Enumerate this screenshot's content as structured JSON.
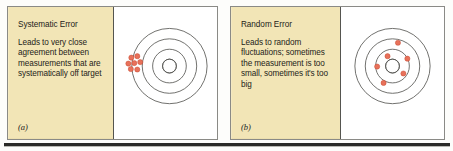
{
  "figure": {
    "background_color": "#fdfdfb",
    "rule_color": "#2b2b28"
  },
  "panels": [
    {
      "id": "a",
      "label": "(a)",
      "title": "Systematic Error",
      "body": "Leads to very close agreement between measurements that are systematically off target",
      "pane_color": "#f2e5b6",
      "target": {
        "center": {
          "x": 56,
          "y": 59
        },
        "ring_radii": [
          7,
          17,
          27.5,
          38,
          48.5
        ],
        "ring_color": "#575753",
        "shot_color": "#e8715a",
        "shot_radius": 2.6,
        "shots": [
          {
            "x": 17.5,
            "y": 50.5
          },
          {
            "x": 23.5,
            "y": 49.0
          },
          {
            "x": 14.5,
            "y": 56.5
          },
          {
            "x": 20.5,
            "y": 56.0
          },
          {
            "x": 26.5,
            "y": 55.0
          },
          {
            "x": 17.0,
            "y": 62.0
          },
          {
            "x": 23.5,
            "y": 62.5
          }
        ]
      }
    },
    {
      "id": "b",
      "label": "(b)",
      "title": "Random Error",
      "body": "Leads to random fluctuations; sometimes the measurement is too small, sometimes it's too big",
      "pane_color": "#f2e5b6",
      "target": {
        "center": {
          "x": 52,
          "y": 59
        },
        "ring_radii": [
          7,
          17,
          27.5,
          38,
          48.5
        ],
        "ring_color": "#575753",
        "shot_color": "#e8715a",
        "shot_radius": 2.6,
        "shots": [
          {
            "x": 57.5,
            "y": 35.5
          },
          {
            "x": 47.0,
            "y": 49.0
          },
          {
            "x": 67.0,
            "y": 51.5
          },
          {
            "x": 36.5,
            "y": 59.5
          },
          {
            "x": 63.0,
            "y": 66.5
          },
          {
            "x": 43.0,
            "y": 76.0
          }
        ]
      }
    }
  ]
}
